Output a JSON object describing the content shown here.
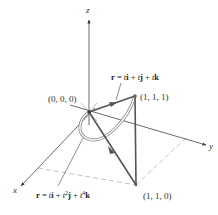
{
  "axes": {
    "x_label": "x",
    "y_label": "y",
    "z_label": "z"
  },
  "points": {
    "origin": "(0, 0, 0)",
    "p111": "(1, 1, 1)",
    "p110": "(1, 1, 0)"
  },
  "equations": {
    "line": {
      "r": "r",
      "eq": " = ",
      "t1": "t",
      "i": "i",
      "plus1": " + ",
      "t2": "t",
      "j": "j",
      "plus2": " + ",
      "t3": "t",
      "k": "k"
    },
    "curve": {
      "r": "r",
      "eq": " = ",
      "t1": "t",
      "i": "i",
      "plus1": " + ",
      "t2": "t",
      "exp2": "2",
      "j": "j",
      "plus2": " + ",
      "t3": "t",
      "exp4": "4",
      "k": "k"
    }
  },
  "colors": {
    "path_line": "#555555",
    "axis": "#444444",
    "dashed": "#999999",
    "curve": "#888888"
  }
}
